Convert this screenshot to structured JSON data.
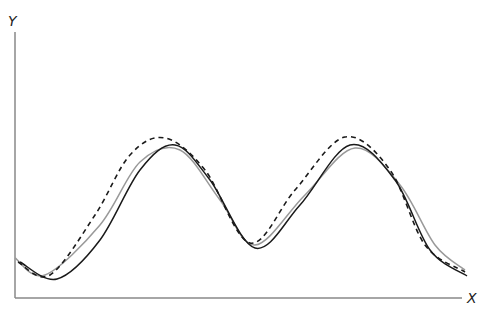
{
  "chart_data": {
    "type": "line",
    "title": "",
    "xlabel": "X",
    "ylabel": "Y",
    "grid": false,
    "legend": null,
    "ticks": false,
    "axis_color": "#888888",
    "series": [
      {
        "name": "solid-black",
        "style": "solid",
        "color": "#1a1a1a",
        "points": [
          [
            20,
            262
          ],
          [
            57,
            279
          ],
          [
            100,
            240
          ],
          [
            140,
            170
          ],
          [
            175,
            145
          ],
          [
            210,
            180
          ],
          [
            255,
            248
          ],
          [
            300,
            205
          ],
          [
            350,
            145
          ],
          [
            395,
            180
          ],
          [
            430,
            250
          ],
          [
            467,
            276
          ]
        ]
      },
      {
        "name": "dashed-black",
        "style": "dashed",
        "color": "#1a1a1a",
        "points": [
          [
            18,
            262
          ],
          [
            50,
            275
          ],
          [
            95,
            215
          ],
          [
            130,
            155
          ],
          [
            165,
            138
          ],
          [
            205,
            170
          ],
          [
            250,
            243
          ],
          [
            295,
            190
          ],
          [
            345,
            137
          ],
          [
            390,
            170
          ],
          [
            425,
            245
          ],
          [
            465,
            272
          ]
        ]
      },
      {
        "name": "solid-gray",
        "style": "solid",
        "color": "#999999",
        "points": [
          [
            15,
            258
          ],
          [
            45,
            275
          ],
          [
            100,
            225
          ],
          [
            140,
            162
          ],
          [
            180,
            150
          ],
          [
            220,
            200
          ],
          [
            255,
            245
          ],
          [
            305,
            195
          ],
          [
            355,
            148
          ],
          [
            400,
            185
          ],
          [
            435,
            245
          ],
          [
            465,
            270
          ]
        ]
      }
    ]
  },
  "labels": {
    "x": "X",
    "y": "Y"
  }
}
